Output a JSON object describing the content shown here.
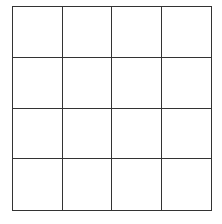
{
  "grid": {
    "rows": 4,
    "columns": 4,
    "line_color": "#333333",
    "background": "#ffffff",
    "cells": [
      [
        "",
        "",
        "",
        ""
      ],
      [
        "",
        "",
        "",
        ""
      ],
      [
        "",
        "",
        "",
        ""
      ],
      [
        "",
        "",
        "",
        ""
      ]
    ]
  }
}
